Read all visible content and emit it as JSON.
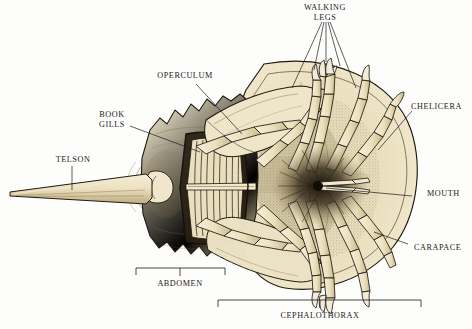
{
  "figure": {
    "view": "ventral",
    "background_color": "#fdfdfb",
    "ink_color": "#1b1b18",
    "carapace_color": "#ece0bd",
    "shadow_color": "#b9a97e"
  },
  "labels": [
    {
      "id": "walking-legs",
      "text": "WALKING\nLEGS",
      "x": 325,
      "y": 4,
      "align": "center"
    },
    {
      "id": "operculum",
      "text": "OPERCULUM",
      "x": 185,
      "y": 74,
      "align": "center"
    },
    {
      "id": "chelicera",
      "text": "CHELICERA",
      "x": 441,
      "y": 106,
      "align": "center"
    },
    {
      "id": "book-gills",
      "text": "BOOK\nGILLS",
      "x": 112,
      "y": 113,
      "align": "center"
    },
    {
      "id": "telson",
      "text": "TELSON",
      "x": 73,
      "y": 158,
      "align": "center"
    },
    {
      "id": "mouth",
      "text": "MOUTH",
      "x": 448,
      "y": 192,
      "align": "center"
    },
    {
      "id": "carapace",
      "text": "CARAPACE",
      "x": 440,
      "y": 247,
      "align": "center"
    },
    {
      "id": "abdomen",
      "text": "ABDOMEN",
      "x": 180,
      "y": 286,
      "align": "center"
    },
    {
      "id": "cephalothorax",
      "text": "CEPHALOTHORAX",
      "x": 320,
      "y": 316,
      "align": "center"
    }
  ],
  "brackets": [
    {
      "id": "abdomen-bracket",
      "label": "ABDOMEN",
      "x1": 136,
      "x2": 225,
      "y": 268,
      "tick_x": 180
    },
    {
      "id": "cephalothorax-bracket",
      "label": "CEPHALOTHORAX",
      "x1": 218,
      "x2": 421,
      "y": 300,
      "tick_x": 320
    }
  ],
  "leader_lines": {
    "walking_legs_targets": 5,
    "note": "fan of leaders from WALKING LEGS text to five leg tips"
  }
}
